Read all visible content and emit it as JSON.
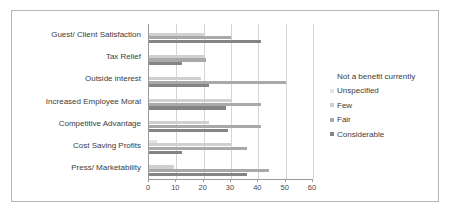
{
  "chart_data": {
    "type": "bar",
    "orientation": "horizontal",
    "title": "",
    "xlabel": "",
    "ylabel": "",
    "xlim": [
      0,
      60
    ],
    "xticks": [
      0,
      10,
      20,
      30,
      40,
      50,
      60
    ],
    "grid": true,
    "legend_position": "right",
    "categories": [
      "Guest/ Client Satisfaction",
      "Tax Relief",
      "Outside interest",
      "Increased Employee Moral",
      "Competitive Advantage",
      "Cost Saving Profits",
      "Press/ Marketability"
    ],
    "series": [
      {
        "name": "Not a benefit currently",
        "color": "#ffffff",
        "values": [
          0,
          0,
          0,
          0,
          0,
          0,
          0
        ]
      },
      {
        "name": "Unspecified",
        "color": "#e3e3e3",
        "values": [
          0,
          0,
          0,
          0,
          0,
          3,
          0
        ]
      },
      {
        "name": "Few",
        "color": "#d0d0d0",
        "values": [
          20,
          20,
          19,
          30,
          22,
          30,
          9
        ]
      },
      {
        "name": "Fair",
        "color": "#a9a9a9",
        "values": [
          30,
          21,
          50,
          41,
          41,
          36,
          44
        ]
      },
      {
        "name": "Considerable",
        "color": "#848484",
        "values": [
          41,
          12,
          22,
          28,
          29,
          12,
          36
        ]
      }
    ]
  }
}
